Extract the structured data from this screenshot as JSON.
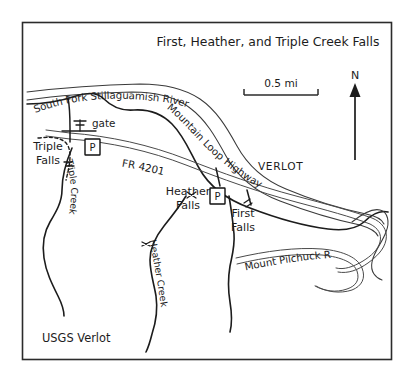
{
  "figure": {
    "title": "First, Heather, and Triple Creek Falls",
    "source_note": "USGS Verlot",
    "background_color": "#ffffff",
    "frame_color": "#2b2b2b",
    "ink_color": "#1c1c1c"
  },
  "scale_bar": {
    "label": "0.5 mi"
  },
  "north_arrow": {
    "label": "N"
  },
  "labels": {
    "river": "South Fork Stillaguamish River",
    "highway": "Mountain Loop Highway",
    "forest_road": "FR 4201",
    "mount_pilchuck_road": "Mount Pilchuck Road",
    "triple_creek": "Triple Creek",
    "heather_creek": "Heather Creek",
    "gate": "gate",
    "town": "VERLOT"
  },
  "falls": [
    {
      "name_line1": "Triple",
      "name_line2": "Falls"
    },
    {
      "name_line1": "Heather",
      "name_line2": "Falls"
    },
    {
      "name_line1": "First",
      "name_line2": "Falls"
    }
  ],
  "parking": [
    {
      "symbol": "P"
    },
    {
      "symbol": "P"
    }
  ],
  "river_text_runs": [
    "South",
    "Fork",
    "Stillagua",
    "mish",
    "River"
  ],
  "highway_text_runs": [
    "Mountain",
    "Loop",
    "Highway"
  ]
}
